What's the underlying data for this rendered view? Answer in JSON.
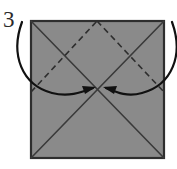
{
  "figure": {
    "kind": "origami-diagram",
    "step_number": "3",
    "caption": "",
    "background_color": "#ffffff"
  },
  "paper": {
    "label": "square-sheet",
    "fill_color": "#8a8a8a",
    "edge_color": "#2e2e2e",
    "edge_width": 2.2,
    "left": 31,
    "top": 21,
    "right": 164,
    "bottom": 158,
    "width": 133,
    "height": 137
  },
  "creases": {
    "solid": {
      "name": "existing-diagonal-creases",
      "color": "#3a3a3a",
      "width": 1.6,
      "lines": [
        {
          "name": "diagonal-tl-br",
          "x1": 31,
          "y1": 21,
          "x2": 164,
          "y2": 158
        },
        {
          "name": "diagonal-tr-bl",
          "x1": 164,
          "y1": 21,
          "x2": 31,
          "y2": 158
        }
      ]
    },
    "dashed": {
      "name": "valley-fold-lines",
      "color": "#2e2e2e",
      "width": 1.6,
      "dash_pattern": "6 4",
      "lines": [
        {
          "name": "dashed-left-to-peak",
          "x1": 31,
          "y1": 92,
          "x2": 97,
          "y2": 21
        },
        {
          "name": "dashed-peak-to-right",
          "x1": 97,
          "y1": 21,
          "x2": 164,
          "y2": 92
        }
      ]
    }
  },
  "arrows": [
    {
      "name": "fold-arrow-left",
      "direction": "corner-to-center",
      "color": "#111111",
      "width": 2.2,
      "path": "M 22 22 C 10 55, 22 85, 52 93 C 68 97, 80 93, 93 88",
      "head_tip": [
        96,
        87
      ],
      "head_points": "96,87 82,86 85,94"
    },
    {
      "name": "fold-arrow-right",
      "direction": "corner-to-center",
      "color": "#111111",
      "width": 2.2,
      "path": "M 172 22 C 184 55, 172 85, 142 93 C 128 97, 118 93, 106 88",
      "head_tip": [
        103,
        87
      ],
      "head_points": "103,87 117,86 114,94"
    }
  ],
  "center_point": {
    "name": "sheet-center",
    "x": 97.5,
    "y": 89.5
  },
  "step_label": {
    "text": "3",
    "x": 3,
    "y": 27
  }
}
